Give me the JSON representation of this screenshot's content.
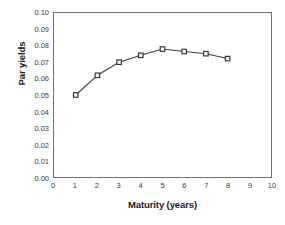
{
  "chart_data": {
    "type": "line",
    "title": "",
    "xlabel": "Maturity (years)",
    "ylabel": "Par yields",
    "x": [
      1,
      2,
      3,
      4,
      5,
      6,
      7,
      8
    ],
    "values": [
      0.05,
      0.062,
      0.07,
      0.0742,
      0.078,
      0.0765,
      0.0752,
      0.0722
    ],
    "series": [
      {
        "name": "Par yields",
        "x": [
          1,
          2,
          3,
          4,
          5,
          6,
          7,
          8
        ],
        "values": [
          0.05,
          0.062,
          0.07,
          0.0742,
          0.078,
          0.0765,
          0.0752,
          0.0722
        ]
      }
    ],
    "xlim": [
      0,
      10
    ],
    "ylim": [
      0.0,
      0.1
    ],
    "xticks": [
      0,
      1,
      2,
      3,
      4,
      5,
      6,
      7,
      8,
      9,
      10
    ],
    "xtick_labels": [
      "0",
      "1",
      "2",
      "3",
      "4",
      "5",
      "6",
      "7",
      "8",
      "9",
      "10"
    ],
    "yticks": [
      0.0,
      0.01,
      0.02,
      0.03,
      0.04,
      0.05,
      0.06,
      0.07,
      0.08,
      0.09,
      0.1
    ],
    "ytick_labels": [
      "0.00",
      "0.01",
      "0.02",
      "0.03",
      "0.04",
      "0.05",
      "0.06",
      "0.07",
      "0.08",
      "0.09",
      "0.10"
    ],
    "grid": false,
    "legend": false,
    "marker": "open-square",
    "line_color": "#3d3d3d",
    "marker_fill": "#f2f2f2",
    "marker_edge": "#2b2b2b",
    "frame_color": "#6f6f6f",
    "background": "#ffffff"
  }
}
